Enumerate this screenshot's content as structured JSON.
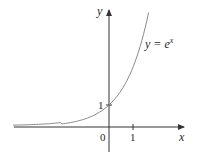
{
  "chart_data": {
    "type": "line",
    "title": "",
    "function_label": "y = e^x",
    "function_label_base": "y = e",
    "function_label_exp": "x",
    "xlabel": "x",
    "ylabel": "y",
    "x_ticks": [
      {
        "value": 1,
        "label": "1"
      }
    ],
    "y_ticks": [
      {
        "value": 1,
        "label": "1"
      }
    ],
    "origin_label": "0",
    "xlim": [
      -4,
      3.1
    ],
    "ylim": [
      -1.1,
      5.4
    ],
    "grid": false,
    "legend": "none",
    "series": [
      {
        "name": "y = e^x",
        "x": [
          -4,
          -3,
          -2,
          -1,
          0,
          0.5,
          1,
          1.5,
          1.65
        ],
        "values": [
          0.018,
          0.05,
          0.135,
          0.368,
          1,
          1.649,
          2.718,
          4.482,
          5.207
        ]
      }
    ],
    "annotations": [
      {
        "label": "1",
        "point": [
          0,
          1
        ]
      }
    ]
  },
  "colors": {
    "axis": "#333333",
    "curve": "#8a8a8a",
    "text": "#2a2a2a"
  }
}
